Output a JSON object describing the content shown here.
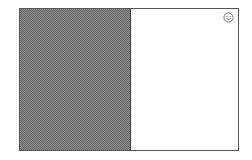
{
  "window": {
    "left_panel": {
      "pattern": "dithered-gray",
      "color": "#8a8a8a"
    },
    "right_panel": {
      "color": "#ffffff"
    },
    "icon": "smiley-face-icon"
  }
}
